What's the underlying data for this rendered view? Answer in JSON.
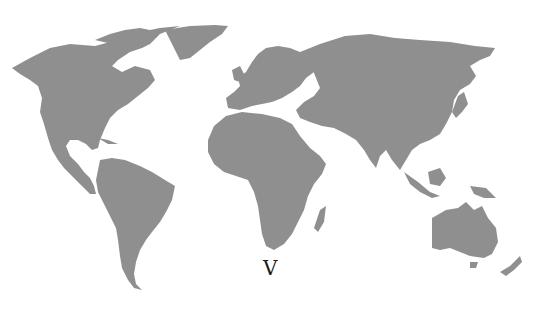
{
  "map": {
    "type": "world-map",
    "projection": "equirectangular-like",
    "land_color": "#8f8f8f",
    "background_color": "#ffffff",
    "regions": [
      "north-america",
      "greenland",
      "south-america",
      "europe",
      "africa",
      "madagascar",
      "asia",
      "japan",
      "southeast-asia",
      "australia",
      "new-zealand"
    ]
  },
  "label": {
    "text": "V",
    "color": "#1a1a1a"
  }
}
